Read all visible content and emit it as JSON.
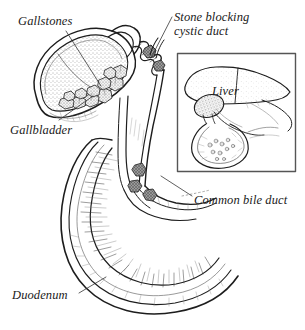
{
  "figure": {
    "style": "pen-and-ink medical line illustration, black on white",
    "width": 305,
    "height": 330,
    "ink_color": "#1d1d1d",
    "background_color": "#ffffff"
  },
  "labels": {
    "gallstones": "Gallstones",
    "gallbladder": "Gallbladder",
    "duodenum": "Duodenum",
    "stone_blocking": "Stone blocking\ncystic duct",
    "stone_blocking_line1": "Stone blocking",
    "stone_blocking_line2": "cystic duct",
    "common_bile_duct": "Common bile duct",
    "liver": "Liver"
  },
  "inset": {
    "name": "liver-orientation-inset",
    "border_color": "#555555",
    "x": 177,
    "y": 53,
    "width": 119,
    "height": 119,
    "contents": [
      "liver",
      "gallbladder",
      "duodenum"
    ]
  },
  "anatomy": {
    "structures": [
      {
        "name": "gallbladder",
        "description": "Cut-away pear-shaped sac at upper left, interior stippled, filled with gallstones"
      },
      {
        "name": "gallstones",
        "description": "Cluster of irregular faceted stones resting in the fundus of the gallbladder",
        "count_visible": 11
      },
      {
        "name": "cystic-duct",
        "description": "Short zigzag/valved duct leaving the gallbladder neck, with a single stone impacted in it"
      },
      {
        "name": "impacted-stone",
        "description": "Dark shaded stone obstructing the cystic duct"
      },
      {
        "name": "common-bile-duct",
        "description": "Long vertical duct descending from the duct junction to the duodenal wall"
      },
      {
        "name": "common-bile-duct-stones",
        "description": "Two to three stones lodged in the distal common bile duct near the ampulla"
      },
      {
        "name": "duodenum",
        "description": "C-shaped loop of small intestine, cut open, showing circular mucosal folds (plicae circulares)"
      },
      {
        "name": "ampulla",
        "description": "Opening of the common bile duct into the duodenal wall"
      }
    ]
  },
  "leader_lines": [
    {
      "name": "gallstones-leader",
      "from": [
        66,
        30
      ],
      "to": [
        100,
        85
      ]
    },
    {
      "name": "gallbladder-leader",
      "from": [
        58,
        120
      ],
      "to": [
        92,
        95
      ]
    },
    {
      "name": "duodenum-leader",
      "from": [
        78,
        293
      ],
      "to": [
        105,
        277
      ]
    },
    {
      "name": "stone-leader",
      "from": [
        172,
        16
      ],
      "to": [
        150,
        60
      ]
    },
    {
      "name": "cbd-leader",
      "from": [
        192,
        196
      ],
      "to": [
        160,
        175
      ]
    }
  ]
}
